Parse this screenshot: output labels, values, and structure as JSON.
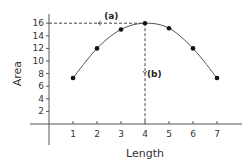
{
  "chart_data": {
    "type": "line",
    "title": "",
    "xlabel": "Length",
    "ylabel": "Area",
    "x": [
      1,
      2,
      3,
      4,
      5,
      6,
      7
    ],
    "series": [
      {
        "name": "Area",
        "values": [
          7.3,
          12,
          15,
          16,
          15.2,
          12,
          7.3
        ]
      }
    ],
    "x_ticks": [
      "1",
      "2",
      "3",
      "4",
      "5",
      "6",
      "7"
    ],
    "y_ticks": [
      "2",
      "4",
      "6",
      "8",
      "10",
      "12",
      "14",
      "16"
    ],
    "xlim": [
      0,
      8
    ],
    "ylim": [
      0,
      17
    ],
    "grid": false,
    "annotations": [
      {
        "label": "(a)",
        "description": "dashed horizontal line from max point to y-axis at 16"
      },
      {
        "label": "(b)",
        "description": "dashed vertical line from max point down to x-axis at 4"
      }
    ]
  },
  "colors": {
    "axis": "#555555",
    "line": "#555555",
    "marker": "#111111",
    "dash": "#444444"
  }
}
